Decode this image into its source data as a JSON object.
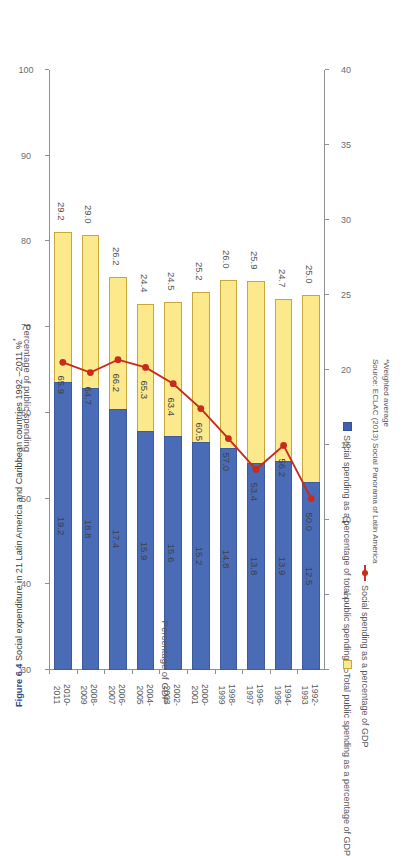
{
  "title": {
    "figure_number": "Figure 6.4",
    "text": "Social expenditure in 21 Latin America and Caribbean countries 1992 –2011 %",
    "superscript": "*"
  },
  "footnotes": {
    "note": "*Weighted average",
    "source": "Source: ECLAC (2013) Social Panorama of Latin America"
  },
  "legend": {
    "items": [
      {
        "label": "Total public spending as a percentage of GDP",
        "marker": "yellow-swatch",
        "color": "#fbe98c"
      },
      {
        "label": "Social spending as a percentage of total public spending",
        "marker": "blue-swatch",
        "color": "#3f5fae"
      },
      {
        "label": "Social spending as a percentage of GDP",
        "marker": "red-line-marker",
        "color": "#c62b1b"
      }
    ]
  },
  "chart_data": {
    "type": "bar",
    "title": "Social expenditure in 21 Latin America and Caribbean countries 1992 –2011 %*",
    "categories": [
      "1992-\n1993",
      "1994-\n1995",
      "1996-\n1997",
      "1998-\n1999",
      "2000-\n2001",
      "2002-\n2003",
      "2004-\n2005",
      "2006-\n2007",
      "2008-\n2009",
      "2010-\n2011"
    ],
    "categories_flat": [
      "1992-1993",
      "1994-1995",
      "1996-1997",
      "1998-1999",
      "2000-2001",
      "2002-2003",
      "2004-2005",
      "2006-2007",
      "2008-2009",
      "2010-2011"
    ],
    "series": [
      {
        "name": "Social spending as a percentage of GDP",
        "type": "bar",
        "axis": "left",
        "color": "#4a6bb5",
        "values": [
          12.5,
          13.9,
          13.8,
          14.8,
          15.2,
          15.6,
          15.9,
          17.4,
          18.8,
          19.2
        ]
      },
      {
        "name": "Total public spending as a percentage of GDP",
        "type": "bar",
        "axis": "left",
        "color": "#fbe98c",
        "values": [
          25.0,
          24.7,
          25.9,
          26.0,
          25.2,
          24.5,
          24.4,
          26.2,
          29.0,
          29.2
        ]
      },
      {
        "name": "Social spending as a percentage of total public spending",
        "type": "line",
        "axis": "right",
        "color": "#c62b1b",
        "values": [
          50.0,
          56.2,
          53.4,
          57.0,
          60.5,
          63.4,
          65.3,
          66.2,
          64.7,
          65.9
        ]
      }
    ],
    "xlabel": "",
    "ylabel": "Percentage of GDP",
    "y2label": "Percentage of public spending",
    "ylim": [
      0,
      40
    ],
    "y2lim": [
      30,
      100
    ],
    "yticks": [
      0,
      5,
      10,
      15,
      20,
      25,
      30,
      35,
      40
    ],
    "y2ticks": [
      30,
      40,
      50,
      60,
      70,
      80,
      90,
      100
    ],
    "grid": false,
    "legend_position": "bottom"
  },
  "axes": {
    "left": {
      "title": "Percentage of GDP",
      "ticks": [
        "0",
        "5",
        "10",
        "15",
        "20",
        "25",
        "30",
        "35",
        "40"
      ]
    },
    "right": {
      "title": "Percentage of public spending",
      "ticks": [
        "30",
        "40",
        "50",
        "60",
        "70",
        "80",
        "90",
        "100"
      ]
    }
  }
}
